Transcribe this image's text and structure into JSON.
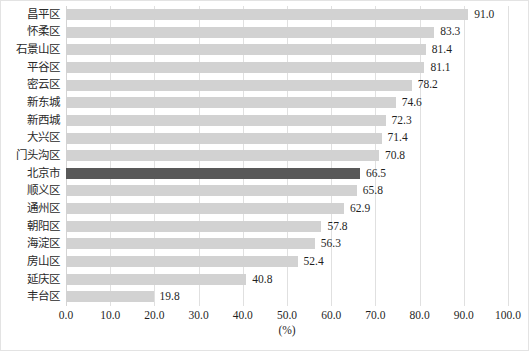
{
  "chart_data": {
    "type": "bar",
    "orientation": "horizontal",
    "title": "",
    "subtitle": "",
    "xlabel": "(%)",
    "ylabel": "",
    "xlim": [
      0,
      100
    ],
    "xticks": [
      "0.0",
      "10.0",
      "20.0",
      "30.0",
      "40.0",
      "50.0",
      "60.0",
      "70.0",
      "80.0",
      "90.0",
      "100.0"
    ],
    "xtick_values": [
      0,
      10,
      20,
      30,
      40,
      50,
      60,
      70,
      80,
      90,
      100
    ],
    "grid": "vertical",
    "legend": "none",
    "categories": [
      "昌平区",
      "怀柔区",
      "石景山区",
      "平谷区",
      "密云区",
      "新东城",
      "新西城",
      "大兴区",
      "门头沟区",
      "北京市",
      "顺义区",
      "通州区",
      "朝阳区",
      "海淀区",
      "房山区",
      "延庆区",
      "丰台区"
    ],
    "values": [
      91.0,
      83.3,
      81.4,
      81.1,
      78.2,
      74.6,
      72.3,
      71.4,
      70.8,
      66.5,
      65.8,
      62.9,
      57.8,
      56.3,
      52.4,
      40.8,
      19.8
    ],
    "value_labels": [
      "91.0",
      "83.3",
      "81.4",
      "81.1",
      "78.2",
      "74.6",
      "72.3",
      "71.4",
      "70.8",
      "66.5",
      "65.8",
      "62.9",
      "57.8",
      "56.3",
      "52.4",
      "40.8",
      "19.8"
    ],
    "highlight_index": 9,
    "highlight_category": "北京市",
    "colors": {
      "bar": "#d2d2d2",
      "bar_highlight": "#595959",
      "gridline": "#e0e0e0",
      "text": "#1f1f1f",
      "background": "#ffffff",
      "frame_border": "#e3e3e3"
    }
  }
}
